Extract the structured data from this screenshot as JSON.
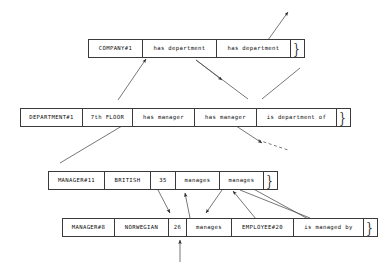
{
  "diagram": {
    "kind": "record-relationship-diagram",
    "background_color": "#ffffff",
    "line_color": "#3a3a3a",
    "text_color": "#0d0d0d",
    "rows": [
      {
        "id": "company-row",
        "cells": [
          {
            "name": "company-id",
            "text": "COMPANY#1"
          },
          {
            "name": "has-department-1",
            "text": "has department"
          },
          {
            "name": "has-department-2",
            "text": "has department"
          },
          {
            "name": "company-continuation",
            "text": "}"
          }
        ]
      },
      {
        "id": "department-row",
        "cells": [
          {
            "name": "department-id",
            "text": "DEPARTMENT#1"
          },
          {
            "name": "department-floor",
            "text": "7th FLOOR"
          },
          {
            "name": "has-manager-1",
            "text": "has manager"
          },
          {
            "name": "has-manager-2",
            "text": "has manager"
          },
          {
            "name": "is-department-of",
            "text": "is department of"
          },
          {
            "name": "department-continuation",
            "text": "}"
          }
        ]
      },
      {
        "id": "manager-11-row",
        "cells": [
          {
            "name": "manager-id",
            "text": "MANAGER#11"
          },
          {
            "name": "manager-nationality",
            "text": "BRITISH"
          },
          {
            "name": "manager-age",
            "text": "35"
          },
          {
            "name": "manages-1",
            "text": "manages"
          },
          {
            "name": "manages-2",
            "text": "manages"
          },
          {
            "name": "manager-continuation",
            "text": "}"
          }
        ]
      },
      {
        "id": "manager-8-row",
        "cells": [
          {
            "name": "manager-id",
            "text": "MANAGER#8"
          },
          {
            "name": "manager-nationality",
            "text": "NORWEGIAN"
          },
          {
            "name": "manager-age",
            "text": "26"
          },
          {
            "name": "manages-1",
            "text": "manages"
          },
          {
            "name": "manager-continuation",
            "text": "}"
          }
        ]
      },
      {
        "id": "employee-row",
        "cells": [
          {
            "name": "employee-id",
            "text": "EMPLOYEE#20"
          },
          {
            "name": "is-managed-by",
            "text": "is managed by"
          },
          {
            "name": "employee-continuation",
            "text": "}"
          }
        ]
      }
    ]
  }
}
